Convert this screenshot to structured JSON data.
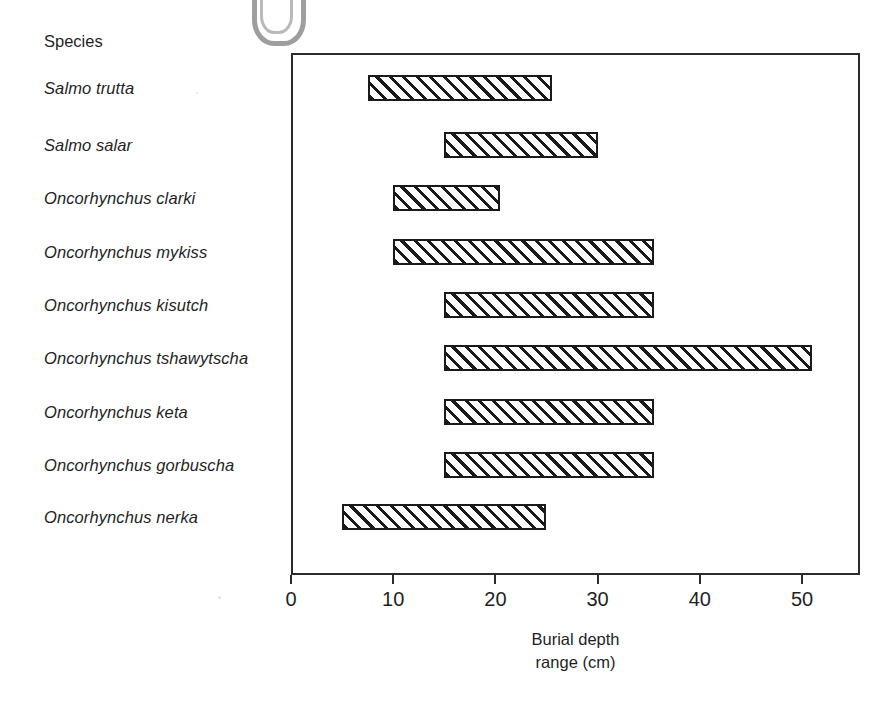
{
  "chart_data": {
    "type": "bar",
    "orientation": "horizontal",
    "subtype": "range-bar",
    "title": "",
    "xlabel": "Burial depth range (cm)",
    "ylabel": "Species",
    "xlim": [
      0,
      55.6
    ],
    "xticks": [
      0,
      10,
      20,
      30,
      40,
      50
    ],
    "xtick_labels": [
      "0",
      "10",
      "20",
      "30",
      "40",
      "50"
    ],
    "grid": false,
    "legend": false,
    "categories": [
      "Salmo trutta",
      "Salmo salar",
      "Oncorhynchus clarki",
      "Oncorhynchus mykiss",
      "Oncorhynchus kisutch",
      "Oncorhynchus tshawytscha",
      "Oncorhynchus keta",
      "Oncorhynchus gorbuscha",
      "Oncorhynchus nerka"
    ],
    "ranges": [
      {
        "species": "Salmo trutta",
        "start": 7.5,
        "end": 25.5
      },
      {
        "species": "Salmo salar",
        "start": 15.0,
        "end": 30.0
      },
      {
        "species": "Oncorhynchus clarki",
        "start": 10.0,
        "end": 20.5
      },
      {
        "species": "Oncorhynchus mykiss",
        "start": 10.0,
        "end": 35.5
      },
      {
        "species": "Oncorhynchus kisutch",
        "start": 15.0,
        "end": 35.5
      },
      {
        "species": "Oncorhynchus tshawytscha",
        "start": 15.0,
        "end": 51.0
      },
      {
        "species": "Oncorhynchus keta",
        "start": 15.0,
        "end": 35.5
      },
      {
        "species": "Oncorhynchus gorbuscha",
        "start": 15.0,
        "end": 35.5
      },
      {
        "species": "Oncorhynchus nerka",
        "start": 5.0,
        "end": 25.0
      }
    ],
    "bar_fill": "diagonal-hatch",
    "bar_edge_color": "#1a1a1a",
    "background_color": "#ffffff"
  },
  "labels": {
    "species_header": "Species",
    "axis_title_line1": "Burial depth",
    "axis_title_line2": "range (cm)"
  }
}
